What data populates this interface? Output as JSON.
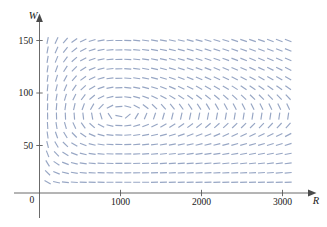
{
  "chart_data": {
    "type": "scatter",
    "subtype": "direction-field",
    "title": "",
    "xlabel": "R",
    "ylabel": "W",
    "xlim": [
      0,
      3250
    ],
    "ylim": [
      0,
      165
    ],
    "grid": false,
    "legend": null,
    "x_ticks": [
      {
        "value": 1000,
        "label": "1000"
      },
      {
        "value": 2000,
        "label": "2000"
      },
      {
        "value": 3000,
        "label": "3000"
      }
    ],
    "y_ticks": [
      {
        "value": 50,
        "label": "50"
      },
      {
        "value": 100,
        "label": "100"
      },
      {
        "value": 150,
        "label": "150"
      }
    ],
    "origin_label": "0",
    "mark_color": "#97a6c4",
    "axis_color": "#5a5a5a",
    "model": {
      "prey_growth": 0.08,
      "prey_predation": 0.001,
      "predator_death": 0.02,
      "predator_gain": 2e-05
    },
    "equilibrium": {
      "R": 1000,
      "W": 80
    },
    "grid_spec": {
      "r_start": 100,
      "r_step": 110,
      "r_count": 28,
      "w_start": 6,
      "w_step": 9,
      "w_count": 17
    },
    "mark_length_px": 7.0
  },
  "axes": {
    "x_name": "R",
    "y_name": "W"
  }
}
